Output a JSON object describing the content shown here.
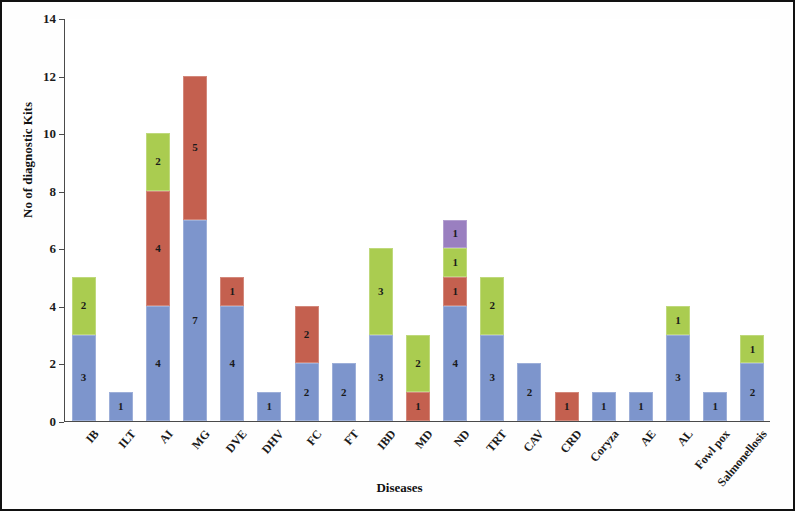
{
  "chart_data": {
    "type": "bar",
    "stacked": true,
    "title": "",
    "xlabel": "Diseases",
    "ylabel": "No of diagnostic Kits",
    "ylim": [
      0,
      14
    ],
    "ytick_values": [
      0,
      2,
      4,
      6,
      8,
      10,
      12,
      14
    ],
    "ytick_labels": [
      "0",
      "2",
      "4",
      "6",
      "8",
      "10",
      "12",
      "14"
    ],
    "grid": false,
    "legend": "none",
    "categories": [
      "IB",
      "ILT",
      "AI",
      "MG",
      "DVE",
      "DHV",
      "FC",
      "FT",
      "IBD",
      "MD",
      "ND",
      "TRT",
      "CAV",
      "CRD",
      "Coryza",
      "AE",
      "AL",
      "Fowl pox",
      "Salmonellosis"
    ],
    "series": [
      {
        "name": "series-1",
        "color": "#7d95cc",
        "values": [
          3,
          1,
          4,
          7,
          4,
          1,
          2,
          2,
          3,
          0,
          4,
          3,
          2,
          0,
          1,
          1,
          3,
          1,
          2
        ]
      },
      {
        "name": "series-2",
        "color": "#c4604f",
        "values": [
          0,
          0,
          4,
          5,
          1,
          0,
          2,
          0,
          0,
          1,
          1,
          0,
          0,
          1,
          0,
          0,
          0,
          0,
          0
        ]
      },
      {
        "name": "series-3",
        "color": "#aacc50",
        "values": [
          2,
          0,
          2,
          0,
          0,
          0,
          0,
          0,
          3,
          2,
          1,
          2,
          0,
          0,
          0,
          0,
          1,
          0,
          1
        ]
      },
      {
        "name": "series-4",
        "color": "#9a7fc0",
        "values": [
          0,
          0,
          0,
          0,
          0,
          0,
          0,
          0,
          0,
          0,
          1,
          0,
          0,
          0,
          0,
          0,
          0,
          0,
          0
        ]
      }
    ],
    "totals": [
      5,
      1,
      10,
      12,
      5,
      1,
      4,
      2,
      6,
      3,
      7,
      5,
      2,
      1,
      1,
      1,
      4,
      1,
      3
    ]
  }
}
